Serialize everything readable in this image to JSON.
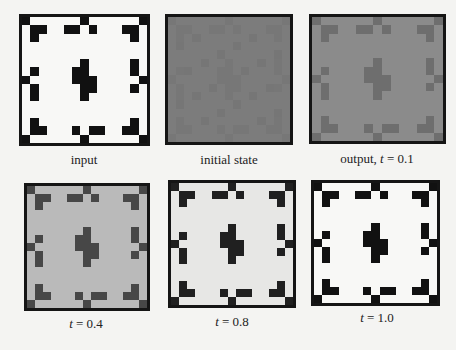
{
  "figure": {
    "grid_size": 15,
    "pattern_cells": [
      [
        0,
        0
      ],
      [
        0,
        7
      ],
      [
        0,
        14
      ],
      [
        1,
        1
      ],
      [
        1,
        2
      ],
      [
        1,
        5
      ],
      [
        1,
        6
      ],
      [
        1,
        8
      ],
      [
        1,
        12
      ],
      [
        1,
        13
      ],
      [
        2,
        1
      ],
      [
        2,
        13
      ],
      [
        5,
        7
      ],
      [
        5,
        13
      ],
      [
        6,
        1
      ],
      [
        6,
        6
      ],
      [
        6,
        7
      ],
      [
        6,
        13
      ],
      [
        7,
        0
      ],
      [
        7,
        6
      ],
      [
        7,
        7
      ],
      [
        7,
        8
      ],
      [
        7,
        14
      ],
      [
        8,
        1
      ],
      [
        8,
        7
      ],
      [
        8,
        8
      ],
      [
        8,
        13
      ],
      [
        9,
        1
      ],
      [
        9,
        7
      ],
      [
        12,
        1
      ],
      [
        12,
        13
      ],
      [
        13,
        1
      ],
      [
        13,
        2
      ],
      [
        13,
        6
      ],
      [
        13,
        8
      ],
      [
        13,
        9
      ],
      [
        13,
        12
      ],
      [
        13,
        13
      ],
      [
        14,
        0
      ],
      [
        14,
        7
      ],
      [
        14,
        14
      ]
    ],
    "panels": [
      {
        "id": "input",
        "label": "input",
        "label_var": "",
        "label_value": "",
        "bg": "#f8f8f6",
        "fg": "#111111",
        "box": [
          19,
          14,
          131,
          132
        ],
        "label_pos": [
          84,
          152
        ]
      },
      {
        "id": "initial-state",
        "label": "initial state",
        "label_var": "",
        "label_value": "",
        "bg": "#7c7c7c",
        "fg": "#777777",
        "box": [
          165,
          14,
          128,
          131
        ],
        "label_pos": [
          229,
          152
        ]
      },
      {
        "id": "output-t-0-1",
        "label": "output, ",
        "label_var": "t",
        "label_value": " = 0.1",
        "bg": "#8b8b8b",
        "fg": "#6e6e6e",
        "box": [
          309,
          14,
          137,
          130
        ],
        "label_pos": [
          377,
          151
        ]
      },
      {
        "id": "t-0-4",
        "label": "",
        "label_var": "t",
        "label_value": " = 0.4",
        "bg": "#bababa",
        "fg": "#474747",
        "box": [
          24,
          183,
          126,
          128
        ],
        "label_pos": [
          86,
          316
        ]
      },
      {
        "id": "t-0-8",
        "label": "",
        "label_var": "t",
        "label_value": " = 0.8",
        "bg": "#e7e7e5",
        "fg": "#202020",
        "box": [
          168,
          180,
          128,
          128
        ],
        "label_pos": [
          232,
          314
        ]
      },
      {
        "id": "t-1-0",
        "label": "",
        "label_var": "t",
        "label_value": " = 1.0",
        "bg": "#f8f8f6",
        "fg": "#111111",
        "box": [
          311,
          180,
          129,
          126
        ],
        "label_pos": [
          377,
          310
        ]
      }
    ]
  }
}
